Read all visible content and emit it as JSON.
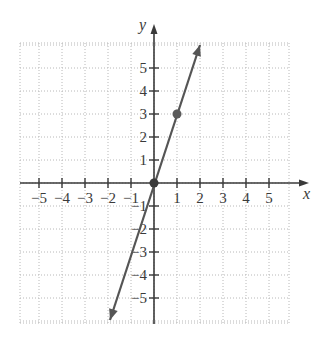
{
  "chart_data": {
    "type": "line",
    "title": "",
    "xlabel": "x",
    "ylabel": "y",
    "xlim": [
      -5.85,
      5.85
    ],
    "ylim": [
      -6,
      6
    ],
    "grid": true,
    "grid_style": "dotted",
    "x_ticks": [
      -5,
      -4,
      -3,
      -2,
      -1,
      1,
      2,
      3,
      4,
      5
    ],
    "y_ticks": [
      -5,
      -4,
      -3,
      -2,
      -1,
      1,
      2,
      3,
      4,
      5
    ],
    "x_tick_labels": [
      "−5",
      "−4",
      "−3",
      "−2",
      "−1",
      "1",
      "2",
      "3",
      "4",
      "5"
    ],
    "y_tick_labels": [
      "−5",
      "−4",
      "−3",
      "−2",
      "−1",
      "1",
      "2",
      "3",
      "4",
      "5"
    ],
    "series": [
      {
        "name": "y = 3x",
        "equation": "y = 3x",
        "x": [
          -2,
          2
        ],
        "y": [
          -6,
          6
        ],
        "arrows_both_ends": true,
        "color": "#555555"
      }
    ],
    "points": [
      {
        "x": 0,
        "y": 0,
        "color": "#3a3a3a"
      },
      {
        "x": 1,
        "y": 3,
        "color": "#5a5a5a"
      }
    ]
  },
  "colors": {
    "axis": "#3a3a3a",
    "grid": "#b8b8b8",
    "line": "#555555",
    "background": "#ffffff"
  }
}
